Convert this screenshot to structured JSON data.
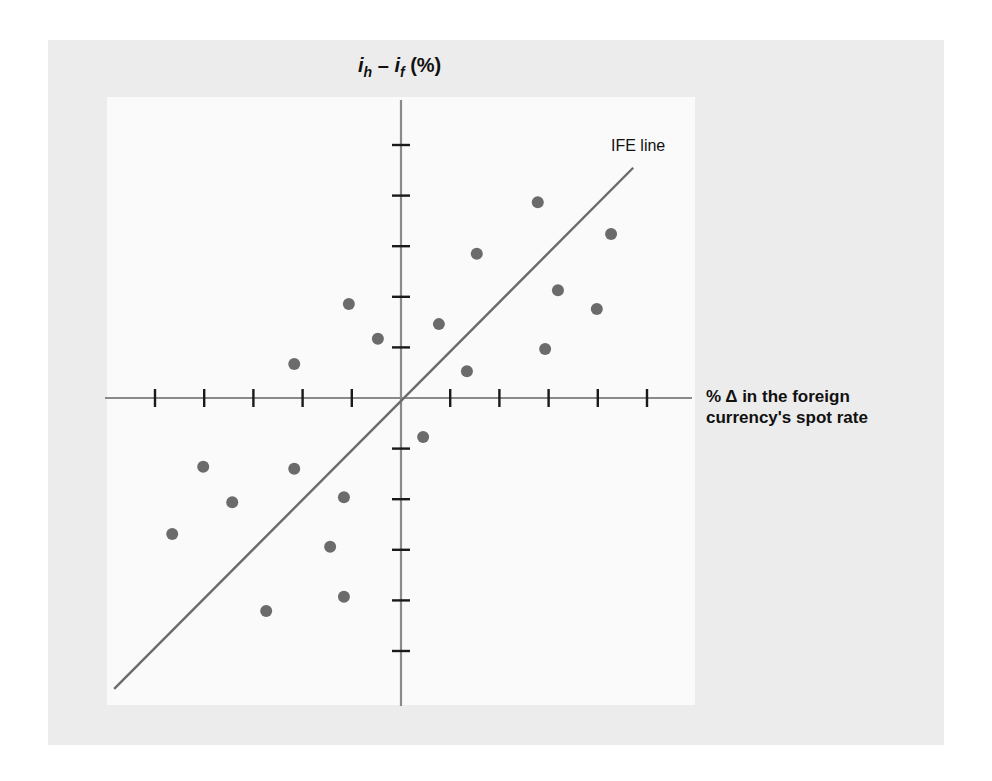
{
  "chart_data": {
    "type": "scatter",
    "title": "",
    "xlabel": "% Δ in the foreign currency's spot rate",
    "ylabel": "i_h − i_f (%)",
    "xlabel_lines": [
      "% Δ in the foreign",
      "currency's spot rate"
    ],
    "ylabel_parts": {
      "i1": "i",
      "sub1": "h",
      "minus": " – ",
      "i2": "i",
      "sub2": "f",
      "unit": " (%)"
    },
    "x_ticks": [
      -5,
      -4,
      -3,
      -2,
      -1,
      1,
      2,
      3,
      4,
      5
    ],
    "y_ticks": [
      -5,
      -4,
      -3,
      -2,
      -1,
      1,
      2,
      3,
      4,
      5
    ],
    "tick_labels_shown": false,
    "xlim": [
      -6,
      6
    ],
    "ylim": [
      -6,
      6
    ],
    "grid": false,
    "legend": null,
    "annotations": [
      {
        "text": "IFE line",
        "x": 4.6,
        "y": 4.9
      }
    ],
    "series": [
      {
        "name": "observations",
        "color": "#6b6b6b",
        "points": [
          {
            "x": -2.17,
            "y": 0.67
          },
          {
            "x": -1.06,
            "y": 1.86
          },
          {
            "x": -0.47,
            "y": 1.17
          },
          {
            "x": 0.77,
            "y": 1.46
          },
          {
            "x": 1.34,
            "y": 0.53
          },
          {
            "x": 1.54,
            "y": 2.85
          },
          {
            "x": 2.78,
            "y": 3.87
          },
          {
            "x": 4.27,
            "y": 3.24
          },
          {
            "x": 3.19,
            "y": 2.13
          },
          {
            "x": 3.98,
            "y": 1.76
          },
          {
            "x": 2.93,
            "y": 0.97
          },
          {
            "x": 0.45,
            "y": -0.77
          },
          {
            "x": -4.02,
            "y": -1.36
          },
          {
            "x": -2.17,
            "y": -1.4
          },
          {
            "x": -3.43,
            "y": -2.06
          },
          {
            "x": -1.16,
            "y": -1.96
          },
          {
            "x": -4.65,
            "y": -2.69
          },
          {
            "x": -1.44,
            "y": -2.94
          },
          {
            "x": -2.74,
            "y": -4.21
          },
          {
            "x": -1.16,
            "y": -3.93
          }
        ]
      },
      {
        "name": "IFE line",
        "type": "line",
        "color": "#6b6b6b",
        "points": [
          {
            "x": -5.83,
            "y": -5.75
          },
          {
            "x": 4.72,
            "y": 4.55
          }
        ]
      }
    ]
  },
  "labels": {
    "ife_line": "IFE line",
    "x_axis_line1": "% Δ in the foreign",
    "x_axis_line2": "currency's spot rate",
    "y_axis_i1": "i",
    "y_axis_sub1": "h",
    "y_axis_minus": " – ",
    "y_axis_i2": "i",
    "y_axis_sub2": "f",
    "y_axis_unit": " (%)"
  },
  "colors": {
    "panel_background": "#ececec",
    "plot_background": "#fafafa",
    "axis": "#8a8a8a",
    "tick": "#1a1a1a",
    "point": "#6b6b6b",
    "ife_line": "#6b6b6b"
  }
}
